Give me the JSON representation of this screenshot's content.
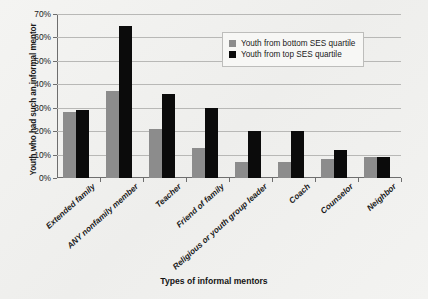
{
  "chart_data": {
    "type": "bar",
    "title": "",
    "xlabel": "Types of informal mentors",
    "ylabel": "Youth who had such an informal mentor",
    "categories": [
      "Extended family",
      "ANY nonfamily member",
      "Teacher",
      "Friend of family",
      "Religious or youth group leader",
      "Coach",
      "Counselor",
      "Neighbor"
    ],
    "series": [
      {
        "name": "Youth from bottom SES quartile",
        "color": "#8c8c8c",
        "values": [
          28,
          37,
          21,
          13,
          7,
          7,
          8,
          9
        ]
      },
      {
        "name": "Youth from top SES quartile",
        "color": "#0b0b0b",
        "values": [
          29,
          65,
          36,
          30,
          20,
          20,
          12,
          9
        ]
      }
    ],
    "ylim": [
      0,
      70
    ],
    "ytick_values": [
      0,
      10,
      20,
      30,
      40,
      50,
      60,
      70
    ],
    "ytick_labels": [
      "0%",
      "10%",
      "20%",
      "30%",
      "40%",
      "50%",
      "60%",
      "70%"
    ],
    "grid": true,
    "legend_position": "top-right"
  }
}
